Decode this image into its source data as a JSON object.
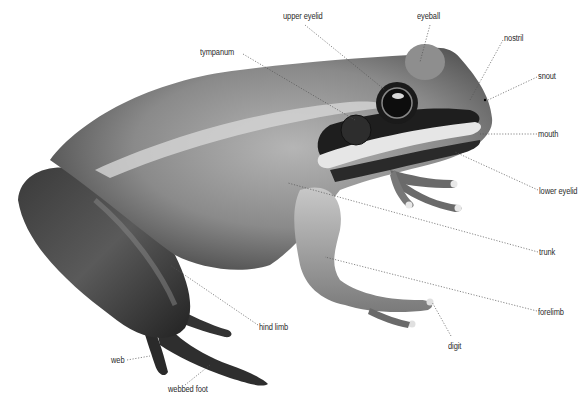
{
  "diagram": {
    "labels": [
      {
        "id": "upper-eyelid",
        "text": "upper eyelid",
        "x": 283,
        "y": 15
      },
      {
        "id": "eyeball",
        "text": "eyeball",
        "x": 417,
        "y": 15
      },
      {
        "id": "nostril",
        "text": "nostril",
        "x": 504,
        "y": 36
      },
      {
        "id": "snout",
        "text": "snout",
        "x": 538,
        "y": 74
      },
      {
        "id": "tympanum",
        "text": "tympanum",
        "x": 200,
        "y": 50
      },
      {
        "id": "mouth",
        "text": "mouth",
        "x": 538,
        "y": 131
      },
      {
        "id": "lower-eyelid",
        "text": "lower eyelid",
        "x": 539,
        "y": 188
      },
      {
        "id": "trunk",
        "text": "trunk",
        "x": 539,
        "y": 249
      },
      {
        "id": "forelimb",
        "text": "forelimb",
        "x": 538,
        "y": 309
      },
      {
        "id": "digit",
        "text": "digit",
        "x": 448,
        "y": 343
      },
      {
        "id": "hind-limb",
        "text": "hind limb",
        "x": 259,
        "y": 325
      },
      {
        "id": "web",
        "text": "web",
        "x": 111,
        "y": 357
      },
      {
        "id": "webbed-foot",
        "text": "webbed foot",
        "x": 168,
        "y": 387
      }
    ]
  }
}
